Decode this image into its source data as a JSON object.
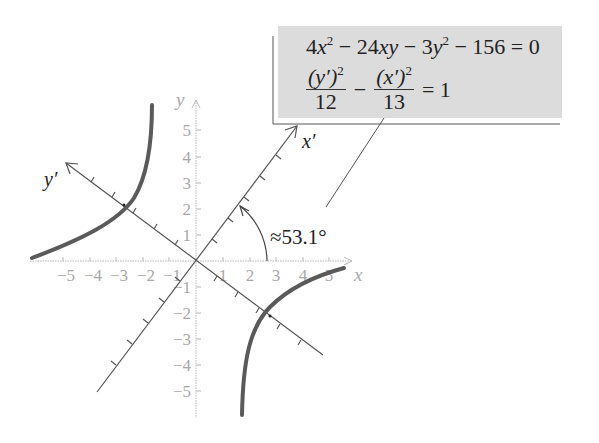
{
  "equation_box": {
    "general_form": {
      "c1": "4",
      "v1": "x",
      "e1": "2",
      "t2": "− 24",
      "v2": "xy",
      "t3": "− 3",
      "v3": "y",
      "e3": "2",
      "t4": "− 156 = 0"
    },
    "standard_form": {
      "num1": "(y′)",
      "num1_exp": "2",
      "den1": "12",
      "minus": "−",
      "num2": "(x′)",
      "num2_exp": "2",
      "den2": "13",
      "rhs": "= 1"
    }
  },
  "axes": {
    "x_label": "x",
    "y_label": "y",
    "x_prime_label": "x′",
    "y_prime_label": "y′",
    "x_ticks": [
      "−5",
      "−4",
      "−3",
      "−2",
      "−1",
      "1",
      "2",
      "3",
      "4",
      "5"
    ],
    "y_ticks": [
      "5",
      "4",
      "3",
      "2",
      "1",
      "−1",
      "−2",
      "−3",
      "−4",
      "−5"
    ]
  },
  "angle_label": "≈53.1°",
  "colors": {
    "curve": "#5a5a5a",
    "axis": "#b8b8b8",
    "rotated_axis": "#555555",
    "box": "#dcdcdc"
  }
}
